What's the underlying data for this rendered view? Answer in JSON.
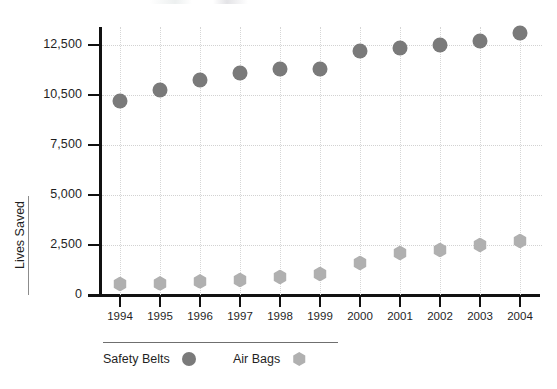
{
  "chart_data": {
    "type": "scatter",
    "title": "",
    "subtitle": "",
    "xlabel": "",
    "ylabel": "Lives Saved",
    "categories": [
      "1994",
      "1995",
      "1996",
      "1997",
      "1998",
      "1999",
      "2000",
      "2001",
      "2002",
      "2003",
      "2004"
    ],
    "x": [
      1994,
      1995,
      1996,
      1997,
      1998,
      1999,
      2000,
      2001,
      2002,
      2003,
      2004
    ],
    "series": [
      {
        "name": "Safety Belts",
        "marker": "circle",
        "color": "#7a7a7a",
        "values": [
          9700,
          10250,
          10750,
          11100,
          11300,
          11300,
          12200,
          12350,
          12500,
          12700,
          13100
        ]
      },
      {
        "name": "Air Bags",
        "marker": "hexagon",
        "color": "#b0b0b0",
        "values": [
          550,
          580,
          680,
          750,
          900,
          1050,
          1600,
          2100,
          2250,
          2500,
          2700
        ]
      }
    ],
    "ytick_labels": [
      "0",
      "2,500",
      "5,000",
      "7,500",
      "10,500",
      "12,500"
    ],
    "ytick_values": [
      0,
      2500,
      5000,
      7500,
      10000,
      12500
    ],
    "ylim": [
      0,
      13500
    ],
    "xlim": [
      1993.5,
      2004.5
    ],
    "grid": true,
    "grid_style": "dotted",
    "legend": [
      "Safety Belts",
      "Air Bags"
    ],
    "legend_position": "bottom-left"
  },
  "axis": {
    "y_title": "Lives Saved"
  },
  "legend": {
    "items": [
      {
        "label": "Safety Belts",
        "swatch": "circle-marker-icon"
      },
      {
        "label": "Air Bags",
        "swatch": "hexagon-marker-icon"
      }
    ]
  },
  "colors": {
    "safety_belts": "#7a7a7a",
    "air_bags": "#b0b0b0",
    "axis": "#111111",
    "grid": "#d4d4d4",
    "text": "#1f1f1f",
    "background": "#ffffff"
  }
}
